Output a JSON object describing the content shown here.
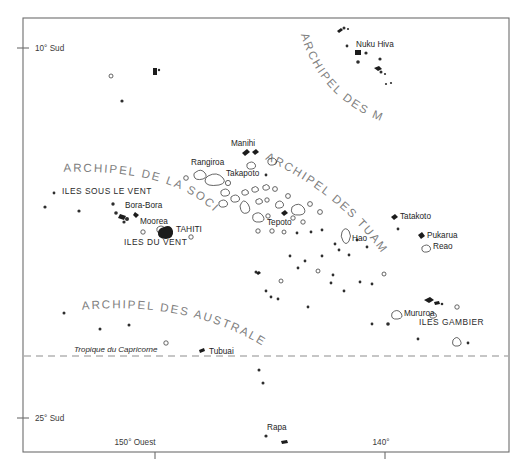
{
  "map": {
    "title": "Polynésie française",
    "frame": {
      "x": 23,
      "y": 18,
      "width": 486,
      "height": 434
    },
    "background_color": "#ffffff",
    "frame_color": "#6d6d6d",
    "archipel_label_color": "#808080",
    "island_color": "#1c1c1c",
    "atoll_stroke_color": "#4a4a4a"
  },
  "axis": {
    "latitude_ticks": [
      {
        "label": "10° Sud",
        "y": 48
      },
      {
        "label": "25° Sud",
        "y": 418
      }
    ],
    "longitude_ticks": [
      {
        "label": "150° Ouest",
        "x": 155
      },
      {
        "label": "140°",
        "x": 385
      }
    ]
  },
  "tropic": {
    "label": "Tropique du Capricorne",
    "y": 355,
    "label_x": 74,
    "label_y": 352
  },
  "archipelagos": [
    {
      "id": "marquises",
      "label": "ARCHIPEL DES MARQUISES"
    },
    {
      "id": "societe",
      "label": "ARCHIPEL DE LA SOCIETE"
    },
    {
      "id": "tuamotu",
      "label": "ARCHIPEL DES TUAMOTU"
    },
    {
      "id": "australes",
      "label": "ARCHIPEL DES AUSTRALES"
    }
  ],
  "group_labels": [
    {
      "id": "iles-sous-le-vent",
      "label": "ILES SOUS LE VENT",
      "x": 62,
      "y": 194
    },
    {
      "id": "iles-du-vent",
      "label": "ILES DU VENT",
      "x": 124,
      "y": 241
    },
    {
      "id": "iles-gambier",
      "label": "ILES GAMBIER",
      "x": 419,
      "y": 325
    }
  ],
  "place_labels": [
    {
      "id": "nuku-hiva",
      "label": "Nuku Hiva",
      "x": 356,
      "y": 47
    },
    {
      "id": "rangiroa",
      "label": "Rangiroa",
      "x": 191,
      "y": 165
    },
    {
      "id": "manihi",
      "label": "Manihi",
      "x": 231,
      "y": 144
    },
    {
      "id": "takapoto",
      "label": "Takapoto",
      "x": 226,
      "y": 174
    },
    {
      "id": "tepoto",
      "label": "Tepoto",
      "x": 267,
      "y": 223
    },
    {
      "id": "bora-bora",
      "label": "Bora-Bora",
      "x": 119,
      "y": 206
    },
    {
      "id": "moorea",
      "label": "Moorea",
      "x": 143,
      "y": 221
    },
    {
      "id": "tahiti",
      "label": "TAHITI",
      "x": 173,
      "y": 229
    },
    {
      "id": "hao",
      "label": "Hao",
      "x": 350,
      "y": 239
    },
    {
      "id": "tatakoto",
      "label": "Tatakoto",
      "x": 398,
      "y": 215
    },
    {
      "id": "pukarua",
      "label": "Pukarua",
      "x": 426,
      "y": 236
    },
    {
      "id": "reao",
      "label": "Reao",
      "x": 432,
      "y": 246
    },
    {
      "id": "mururoa",
      "label": "Mururoa",
      "x": 404,
      "y": 313
    },
    {
      "id": "tubuai",
      "label": "Tubuai",
      "x": 209,
      "y": 352
    },
    {
      "id": "rapa",
      "label": "Rapa",
      "x": 267,
      "y": 430
    }
  ]
}
